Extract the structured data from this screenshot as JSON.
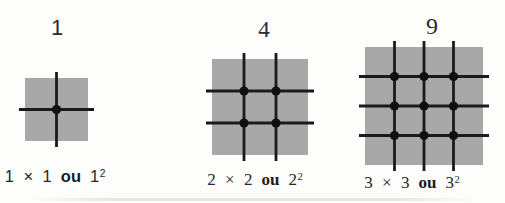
{
  "background": "#fdfdfc",
  "figures": [
    {
      "count_label": "1",
      "grid": 1,
      "equation": {
        "left": "1 × 1",
        "conj": "ou",
        "base": "1",
        "exp": "2"
      },
      "square": {
        "fill": "#a8a8a8",
        "line_color": "#1a1a1a",
        "dot_color": "#0f0f0f"
      }
    },
    {
      "count_label": "4",
      "grid": 2,
      "equation": {
        "left": "2 × 2",
        "conj": "ou",
        "base": "2",
        "exp": "2"
      },
      "square": {
        "fill": "#a8a8a8",
        "line_color": "#1a1a1a",
        "dot_color": "#0f0f0f"
      }
    },
    {
      "count_label": "9",
      "grid": 3,
      "equation": {
        "left": "3 × 3",
        "conj": "ou",
        "base": "3",
        "exp": "2"
      },
      "square": {
        "fill": "#a8a8a8",
        "line_color": "#1a1a1a",
        "dot_color": "#0f0f0f"
      }
    }
  ]
}
